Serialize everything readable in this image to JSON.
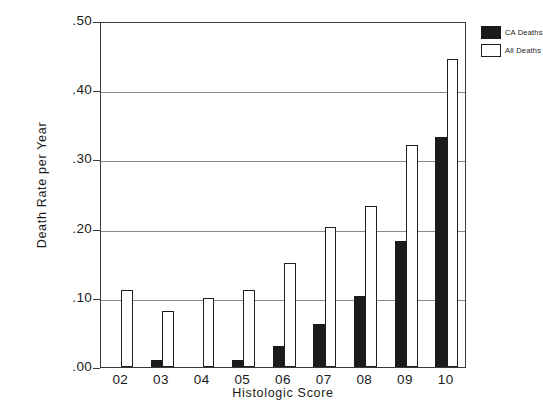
{
  "chart_data": {
    "type": "bar",
    "title": "",
    "xlabel": "Histologic Score",
    "ylabel": "Death Rate per Year",
    "categories": [
      "02",
      "03",
      "04",
      "05",
      "06",
      "07",
      "08",
      "09",
      "10"
    ],
    "series": [
      {
        "name": "CA Deaths",
        "fill": "#1b1b1b",
        "values": [
          0.0,
          0.01,
          0.0,
          0.01,
          0.03,
          0.062,
          0.102,
          0.182,
          0.333
        ]
      },
      {
        "name": "All Deaths",
        "fill": "#ffffff",
        "values": [
          0.111,
          0.081,
          0.1,
          0.111,
          0.151,
          0.202,
          0.233,
          0.321,
          0.445
        ]
      }
    ],
    "ylim": [
      0.0,
      0.5
    ],
    "yticks": [
      0.0,
      0.1,
      0.2,
      0.3,
      0.4,
      0.5
    ],
    "ytick_labels": [
      ".00",
      ".10",
      ".20",
      ".30",
      ".40",
      ".50"
    ],
    "grid": "horizontal",
    "legend_position": "outside-top-right"
  },
  "legend": {
    "entries": [
      {
        "label": "CA Deaths",
        "key": "ca"
      },
      {
        "label": "All Deaths",
        "key": "all"
      }
    ]
  }
}
